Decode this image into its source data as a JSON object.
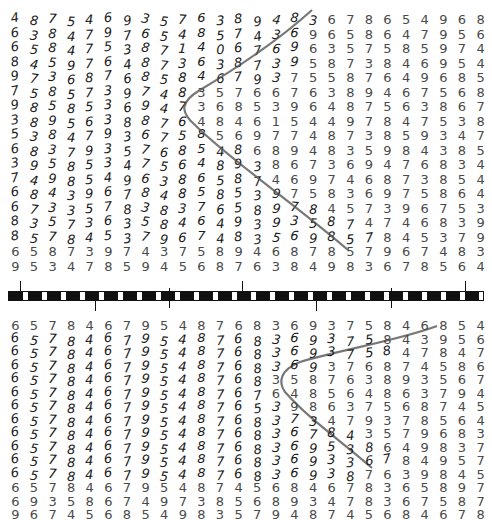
{
  "figure": {
    "top_panel": {
      "rows": [
        "4875469357638948367865496874359 7",
        "63847976548574369658 647956387 45",
        "65847538714067696357585974675843 9",
        "84597648736387395873846954768 93",
        "97368768584679375587649685486795 38",
        "758573974835766763894675687398538 4",
        "985853694736853964875638678479358",
        "389563887648461544978475389458654 7 6",
        "53847936758569774873859347683985 37",
        "683793576854868948359843857935867 8",
        "395853475648938673694768348974587",
        "749854963865874697468738547946582",
        "684396784858539758369758647639 6",
        "673357838376589784573967534867935 8",
        "835736358464939358747468396856",
        "85 7 8 4 5 3 7 9 6 7 4 8 3 5 6 9",
        "6587397437589468785 79 67483569",
        "953478594568763849836785647937 58"
      ],
      "clean_right_rows": [
        "5 4 9 6 8 7 4 3 5 9 7",
        "6 4 7 9 5 6 3 8 7 4 5",
        "8 5 9 7 4 6 7 5 8 4 3 9",
        "8 4 6 9 5 4 7 6 8 9 3",
        "9 6 8 5 4 8 6 7 9 5 3 8",
        "7 5 6 8 7 3 9 8 5 3 8 4",
        "3 8 6 7 8 4 7 9 3 5 8",
        "9 4 5 8 6 5 4 7 6 8 9",
        "3 4 7 6 8 3 9 8 5 3 7",
        "3 8 5 7 9 3 5 8 6 7 8",
        "6 8 3 4 8 9 7 4 5 8 7",
        "7 3 8 5 4 7 9 4 6 5 8",
        "9 7 5 8 6 4 7 6 3 9 6",
        "6 5 3 4 8 6 7 9 3 5 8",
        "7 4 6 7 8 3 9 6 8 5 6",
        "3 7 9 6 7 4 8 3 5 6 9",
        "7 8 5 6 4 7 9 3 7 5 8"
      ],
      "last_row": "9 5 3 4 7 8 5 9 4 5 6 8 7 6 3 8 4 9 8 3 6 7 8 5 6 4 7 9 3 7 5 8",
      "second_last_row": "6 5 8 7 3 9 7 4 3 7 5 8 9 4 6 8 7 9 5 3 7 9 6 7 4 8 3 5 6 9"
    },
    "bottom_panel": {
      "first_row": "6 5 7 8 4 6 7 9 5 4 8 7 6 8 3 6 9 3 7 5 8 4 6 8 5 4 7 8 3 9 5 6",
      "clean_right_rows": [
        "3 9 5 6",
        "7 8 4 7",
        "6 8 7 4 5 8 6",
        "5 8 7 6 3 8 9 3 5 6 7",
        "7 6 4 8 5 6 4 8 6 3 7 9 4",
        "5 3 9 8 6 3 7 5 6 8 7 4 5",
        "7 3 4 7 9 3 7 8 5 6 4",
        "7 8 4 3 5 7 9 6 8 3",
        "5 3 8 6 4 9 8 3 7",
        "3 6 7 8 4 9 5 7",
        "8 7 6 3 9 8 4 5",
        "4 8 7 4 5 6 8 4 6 7 8 3 6 5 8 9 7"
      ],
      "second_last_row": "6 9 3 5 8 6 7 4 9 7 3 8 5 6 8 9 3 4 7 8 3 6 7 5 8 7 6 3 9 8 4 5",
      "last_row": "9 6 7 4 5 6 8 5 4 9 8 3 5 7 9 4 8 7 4 5 6 8 4 6 7 8 3 6 5 8 9 7"
    },
    "scale_bar": {
      "segments": 36
    }
  }
}
